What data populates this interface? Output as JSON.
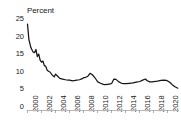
{
  "chart_data": {
    "type": "line",
    "title": "",
    "ylabel": "Percent",
    "xlabel": "",
    "ylim": [
      0,
      25
    ],
    "xlim": [
      2000,
      2021.5
    ],
    "grid": false,
    "legend": null,
    "yticks": [
      25,
      20,
      15,
      10,
      5,
      0
    ],
    "xticks": [
      "2000",
      "2002",
      "2004",
      "2006",
      "2008",
      "2010",
      "2012",
      "2014",
      "2016",
      "2018",
      "2020"
    ],
    "line_color": "#151515",
    "axis_color": "#b9b9b9",
    "series": [
      {
        "name": "Percent",
        "x": [
          2000.0,
          2000.2,
          2000.5,
          2000.8,
          2001.0,
          2001.2,
          2001.4,
          2001.6,
          2001.8,
          2002.0,
          2002.2,
          2002.4,
          2002.6,
          2002.8,
          2003.0,
          2003.2,
          2003.5,
          2003.8,
          2004.0,
          2004.3,
          2004.6,
          2005.0,
          2005.4,
          2005.8,
          2006.0,
          2006.4,
          2006.8,
          2007.0,
          2007.4,
          2007.8,
          2008.0,
          2008.3,
          2008.6,
          2008.9,
          2009.2,
          2009.5,
          2009.8,
          2010.0,
          2010.4,
          2010.8,
          2011.0,
          2011.4,
          2011.8,
          2012.0,
          2012.3,
          2012.6,
          2013.0,
          2013.4,
          2013.8,
          2014.0,
          2014.5,
          2015.0,
          2015.5,
          2016.0,
          2016.4,
          2016.8,
          2017.0,
          2017.4,
          2017.8,
          2018.0,
          2018.5,
          2019.0,
          2019.4,
          2019.8,
          2020.0,
          2020.3,
          2020.6,
          2021.0,
          2021.4
        ],
        "values": [
          23.4,
          19.0,
          16.6,
          15.5,
          15.3,
          16.2,
          14.2,
          14.9,
          13.2,
          12.6,
          12.9,
          11.6,
          11.4,
          10.3,
          10.0,
          9.8,
          9.0,
          8.4,
          9.2,
          8.6,
          8.0,
          7.8,
          7.6,
          7.5,
          7.5,
          7.3,
          7.4,
          7.5,
          7.6,
          7.9,
          8.2,
          8.3,
          8.6,
          9.4,
          9.1,
          8.4,
          7.6,
          7.0,
          6.6,
          6.3,
          6.2,
          6.3,
          6.4,
          6.6,
          7.8,
          7.7,
          7.0,
          6.6,
          6.5,
          6.5,
          6.6,
          6.7,
          6.9,
          7.1,
          7.5,
          7.8,
          7.4,
          7.0,
          7.0,
          7.1,
          7.2,
          7.4,
          7.5,
          7.4,
          7.2,
          6.8,
          6.2,
          5.6,
          5.2
        ]
      }
    ]
  }
}
